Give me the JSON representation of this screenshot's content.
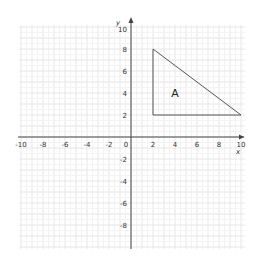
{
  "chart_data": {
    "type": "coordinate-grid",
    "title": "",
    "xlabel": "x",
    "ylabel": "y",
    "xlim": [
      -10,
      10
    ],
    "ylim": [
      -10,
      10
    ],
    "grid": true,
    "x_ticks": [
      -10,
      -8,
      -6,
      -4,
      -2,
      0,
      2,
      4,
      6,
      8,
      10
    ],
    "y_ticks": [
      10,
      8,
      6,
      4,
      2,
      -2,
      -4,
      -6,
      -8
    ],
    "x_tick_labels": [
      "-10",
      "-8",
      "-6",
      "-4",
      "-2",
      "0",
      "2",
      "4",
      "6",
      "8",
      "10"
    ],
    "y_tick_labels": [
      "10",
      "8",
      "6",
      "4",
      "2",
      "-2",
      "-4",
      "-6",
      "-8"
    ],
    "shapes": [
      {
        "name": "A",
        "type": "triangle",
        "vertices": [
          [
            2,
            8
          ],
          [
            2,
            2
          ],
          [
            10,
            2
          ]
        ],
        "label_position": [
          4,
          4
        ]
      }
    ]
  },
  "labels": {
    "x_axis": "x",
    "y_axis": "y",
    "origin": "0",
    "shape_a": "A"
  },
  "colors": {
    "grid": "#e6e6e6",
    "axis": "#444444",
    "shape_stroke": "#555555",
    "text": "#333333"
  }
}
